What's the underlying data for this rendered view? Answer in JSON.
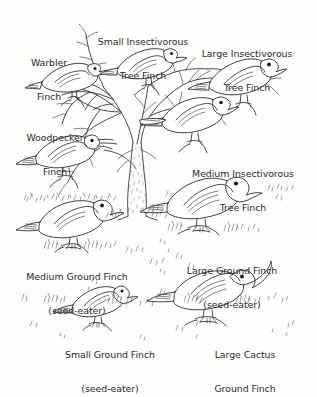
{
  "figure": {
    "title_visible": false,
    "style": "hand-drawn scientific line illustration, black ink on off-white",
    "background_color": "#fdfdfb",
    "ink_color": "#2b2b2b",
    "label_color": "#2b2b2b"
  },
  "labels": [
    {
      "id": "warbler-finch",
      "lines": [
        "Warbler",
        "Finch"
      ],
      "x": 49,
      "y": 37,
      "align": "center"
    },
    {
      "id": "small-insectivorous-tree-finch",
      "lines": [
        "Small Insectivorous",
        "Tree Finch"
      ],
      "x": 143,
      "y": 16,
      "align": "center"
    },
    {
      "id": "large-insectivorous-tree-finch",
      "lines": [
        "Large Insectivorous",
        "Tree Finch"
      ],
      "x": 247,
      "y": 28,
      "align": "center"
    },
    {
      "id": "woodpecker-finch",
      "lines": [
        "Woodpecker",
        "Finch"
      ],
      "x": 55,
      "y": 112,
      "align": "center"
    },
    {
      "id": "medium-insectivorous-tree-finch",
      "lines": [
        "Medium Insectivorous",
        "Tree Finch"
      ],
      "x": 243,
      "y": 148,
      "align": "center"
    },
    {
      "id": "medium-ground-finch",
      "lines": [
        "Medium Ground Finch",
        "(seed-eater)"
      ],
      "x": 77,
      "y": 251,
      "align": "center"
    },
    {
      "id": "large-ground-finch",
      "lines": [
        "Large Ground Finch",
        "(seed-eater)"
      ],
      "x": 232,
      "y": 245,
      "align": "center"
    },
    {
      "id": "small-ground-finch",
      "lines": [
        "Small Ground Finch",
        "(seed-eater)"
      ],
      "x": 110,
      "y": 329,
      "align": "center"
    },
    {
      "id": "large-cactus-ground-finch",
      "lines": [
        "Large Cactus",
        "Ground Finch"
      ],
      "x": 245,
      "y": 329,
      "align": "center"
    }
  ],
  "birds": [
    {
      "id": "warbler-finch",
      "beak": "slender-pointed",
      "posture": "perched",
      "facing": "right"
    },
    {
      "id": "small-insectivorous-tree-finch",
      "beak": "small-conical",
      "posture": "perched",
      "facing": "right"
    },
    {
      "id": "large-insectivorous-tree-finch",
      "beak": "thick-conical",
      "posture": "perched",
      "facing": "right"
    },
    {
      "id": "woodpecker-finch",
      "beak": "long-with-twig",
      "posture": "perched",
      "facing": "right"
    },
    {
      "id": "medium-insectivorous-tree-finch",
      "beak": "medium-conical",
      "posture": "perched",
      "facing": "right"
    },
    {
      "id": "medium-ground-finch",
      "beak": "medium-conical",
      "posture": "standing",
      "facing": "right"
    },
    {
      "id": "large-ground-finch",
      "beak": "large-conical",
      "posture": "standing",
      "facing": "right"
    },
    {
      "id": "small-ground-finch",
      "beak": "small-conical",
      "posture": "standing",
      "facing": "right"
    },
    {
      "id": "large-cactus-ground-finch",
      "beak": "long-decurved",
      "posture": "standing",
      "facing": "right"
    }
  ],
  "tree": {
    "id": "central-tree",
    "trunk_center_x": 136,
    "trunk_base_y": 215,
    "bark_texture": "stippled"
  }
}
